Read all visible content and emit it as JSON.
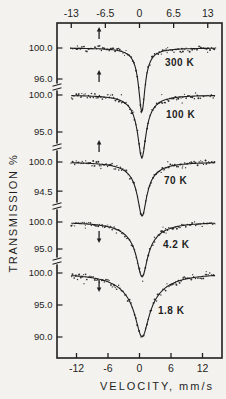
{
  "figure_meta": {
    "description": "Stacked Moessbauer transmission spectra at five temperatures",
    "background_color": "#f4f2ee",
    "ink_color": "#1f1f1f"
  },
  "chart_data": {
    "type": "line",
    "title": "",
    "xlabel": "VELOCITY, mm/s",
    "ylabel": "TRANSMISSION %",
    "grid": false,
    "legend": "temperature labels inside plot area, right of each dip",
    "x_axis": {
      "unit": "mm/s",
      "top_ticks": [
        -13,
        -6.5,
        0,
        6.5,
        13
      ],
      "top_tick_labels": [
        "-13",
        "-6.5",
        "0",
        "6.5",
        "13"
      ],
      "bottom_ticks": [
        -12,
        -6,
        0,
        6,
        12
      ],
      "bottom_tick_labels": [
        "-12",
        "-6",
        "0",
        "6",
        "12"
      ],
      "data_range": [
        -13.0,
        14.5
      ]
    },
    "y_axis": {
      "unit": "%",
      "style": "broken axis, each spectrum has its own 100% reference",
      "tick_label_sequence_top_to_bottom": [
        "100.0",
        "96.0",
        "100.0",
        "95.0",
        "100.0",
        "94.5",
        "100.0",
        "95.0",
        "100.0",
        "95.0",
        "90.0"
      ]
    },
    "series": [
      {
        "temperature_label": "300 K",
        "baseline_pct": 100.0,
        "y_ticks_pct": [
          100.0,
          96.0
        ],
        "y_tick_labels": [
          "100.0",
          "96.0"
        ],
        "dip": {
          "center_mms": 0.45,
          "depth_pct": 8.3,
          "min_transmission_pct": 91.7,
          "core_fwhm_mms": 1.4,
          "wing_fwhm_mms": 4.0,
          "wing_fraction": 0.12
        },
        "arrow": {
          "x_mms": -7.7,
          "direction": "up"
        },
        "noise_pct": 0.22
      },
      {
        "temperature_label": "100 K",
        "baseline_pct": 100.0,
        "y_ticks_pct": [
          100.0,
          95.0
        ],
        "y_tick_labels": [
          "100.0",
          "95.0"
        ],
        "dip": {
          "center_mms": 0.45,
          "depth_pct": 8.5,
          "min_transmission_pct": 91.5,
          "core_fwhm_mms": 1.8,
          "wing_fwhm_mms": 5.0,
          "wing_fraction": 0.18
        },
        "arrow": {
          "x_mms": -7.7,
          "direction": "up"
        },
        "noise_pct": 0.26
      },
      {
        "temperature_label": "70 K",
        "baseline_pct": 100.0,
        "y_ticks_pct": [
          100.0,
          94.5
        ],
        "y_tick_labels": [
          "100.0",
          "94.5"
        ],
        "dip": {
          "center_mms": 0.5,
          "depth_pct": 10.2,
          "min_transmission_pct": 89.8,
          "core_fwhm_mms": 2.0,
          "wing_fwhm_mms": 6.0,
          "wing_fraction": 0.22
        },
        "arrow": {
          "x_mms": -7.7,
          "direction": "up"
        },
        "noise_pct": 0.3
      },
      {
        "temperature_label": "4.2 K",
        "baseline_pct": 100.0,
        "y_ticks_pct": [
          100.0,
          95.0
        ],
        "y_tick_labels": [
          "100.0",
          "95.0"
        ],
        "dip": {
          "center_mms": 0.5,
          "depth_pct": 10.2,
          "min_transmission_pct": 89.8,
          "core_fwhm_mms": 2.3,
          "wing_fwhm_mms": 7.0,
          "wing_fraction": 0.28
        },
        "arrow": {
          "x_mms": -7.7,
          "direction": "down"
        },
        "noise_pct": 0.3
      },
      {
        "temperature_label": "1.8 K",
        "baseline_pct": 100.0,
        "y_ticks_pct": [
          100.0,
          95.0,
          90.0
        ],
        "y_tick_labels": [
          "100.0",
          "95.0",
          "90.0"
        ],
        "dip": {
          "center_mms": 0.5,
          "depth_pct": 10.0,
          "min_transmission_pct": 90.0,
          "core_fwhm_mms": 3.0,
          "wing_fwhm_mms": 9.0,
          "wing_fraction": 0.32
        },
        "arrow": {
          "x_mms": -7.7,
          "direction": "down"
        },
        "noise_pct": 0.32
      }
    ],
    "layout_px": {
      "frame": {
        "left": 57,
        "top": 23,
        "right": 222,
        "bottom": 358
      },
      "x_center": 139.5,
      "px_per_mms": 5.25,
      "baseline_y": [
        48,
        95,
        162,
        222,
        273
      ],
      "px_per_pct": [
        7.75,
        7.4,
        5.3,
        5.4,
        6.4
      ],
      "axis_break_y": [
        87,
        147,
        206,
        261
      ],
      "arrow_top_y": [
        27,
        70,
        140,
        231,
        280
      ],
      "arrow_len": 12
    }
  }
}
